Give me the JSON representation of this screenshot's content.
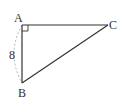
{
  "diagram": {
    "type": "right-triangle",
    "vertices": {
      "A": {
        "label": "A",
        "x": 22,
        "y": 25
      },
      "B": {
        "label": "B",
        "x": 22,
        "y": 83
      },
      "C": {
        "label": "C",
        "x": 108,
        "y": 25
      }
    },
    "right_angle_at": "A",
    "side_labels": [
      {
        "side": "AB",
        "label": "8",
        "style": "dashed-arc"
      }
    ],
    "colors": {
      "stroke": "#333333",
      "dashed_arc": "#aaaaaa",
      "background": "#ffffff"
    }
  }
}
